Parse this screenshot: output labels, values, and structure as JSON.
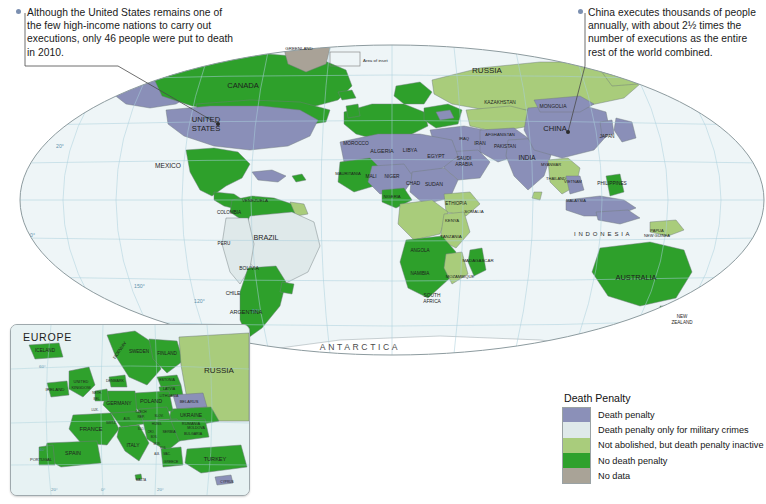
{
  "map": {
    "title": "World Map of the Death Penalty",
    "projection": "Robinson / elliptical world projection",
    "ocean_color": "#eef5f7",
    "graticule_color": "#9ec9d8",
    "border_color": "#8d9b9f"
  },
  "annotations": [
    {
      "id": "united-states-note",
      "text": "Although the United States remains one of the few high-income nations to carry out executions, only 46 people were put to death in 2010.",
      "target": "UNITED STATES"
    },
    {
      "id": "china-note",
      "text": "China executes thousands of people annually, with about 2½ times the number of executions as the entire rest of the world combined.",
      "target": "CHINA"
    }
  ],
  "legend": {
    "title": "Death Penalty",
    "items": [
      {
        "label": "Death penalty",
        "color": "#8b90b8"
      },
      {
        "label": "Death penalty only for military crimes",
        "color": "#dfe9ea"
      },
      {
        "label": "Not abolished, but death penalty inactive",
        "color": "#a9cc7c"
      },
      {
        "label": "No death penalty",
        "color": "#2fa12c"
      },
      {
        "label": "No data",
        "color": "#a9a397"
      }
    ]
  },
  "inset": {
    "title": "EUROPE",
    "note": "Area of inset",
    "labels": [
      "ICELAND",
      "NORWAY",
      "SWEDEN",
      "FINLAND",
      "RUSSIA",
      "ESTONIA",
      "LATVIA",
      "LITHUANIA",
      "BELARUS",
      "UKRAINE",
      "MOLDOVA",
      "POLAND",
      "GERMANY",
      "DENMARK",
      "NETH.",
      "BEL.",
      "LUX.",
      "UNITED KINGDOM",
      "IRELAND",
      "FRANCE",
      "SWITZ.",
      "SPAIN",
      "PORTUGAL",
      "ITALY",
      "CZECH REP.",
      "SLOVAKIA",
      "AUSTRIA",
      "HUNG.",
      "SLOVENIA",
      "CROATIA",
      "BOS. &amp; HERZ.",
      "SERBIA",
      "MONT.",
      "KOS.",
      "MACEDONIA",
      "ALBANIA",
      "GREECE",
      "BULGARIA",
      "RUMANIA",
      "TURKEY",
      "CYPRUS",
      "MALTA",
      "ANDORRA"
    ],
    "graticule_labels": [
      "60°",
      "40°",
      "20°",
      "0°",
      "20°"
    ]
  },
  "graticule": {
    "longitude_labels": [
      "150°",
      "120°",
      "90°",
      "60°",
      "30°",
      "0°",
      "30°",
      "60°",
      "90°",
      "120°",
      "150°"
    ],
    "latitude_labels": [
      "60°",
      "40°",
      "20°",
      "0°",
      "20°",
      "40°",
      "60°"
    ]
  },
  "map_labels": {
    "oceania_continent": "ANTARCTICA",
    "indonesia_spaced": "I N D O N E S I A",
    "regions": [
      {
        "name": "CANADA",
        "x": 243,
        "y": 88,
        "size": 7.6,
        "cls": "big"
      },
      {
        "name": "UNITED\nSTATES",
        "x": 206,
        "y": 122,
        "size": 7.6,
        "cls": "big"
      },
      {
        "name": "MEXICO",
        "x": 168,
        "y": 168,
        "size": 6.6,
        "cls": "big"
      },
      {
        "name": "GREENLAND",
        "x": 299,
        "y": 50,
        "size": 4.4,
        "cls": "sm"
      },
      {
        "name": "BRAZIL",
        "x": 266,
        "y": 240,
        "size": 7.2,
        "cls": "big"
      },
      {
        "name": "ARGENTINA",
        "x": 246,
        "y": 314,
        "size": 5.6,
        "cls": "med"
      },
      {
        "name": "CHILE",
        "x": 233,
        "y": 295,
        "size": 5.0,
        "cls": "med"
      },
      {
        "name": "PERU",
        "x": 224,
        "y": 245,
        "size": 4.6,
        "cls": "sm"
      },
      {
        "name": "BOLIVIA",
        "x": 249,
        "y": 270,
        "size": 5.0,
        "cls": "med"
      },
      {
        "name": "COLOMBIA",
        "x": 229,
        "y": 214,
        "size": 4.6,
        "cls": "sm"
      },
      {
        "name": "VENEZUELA",
        "x": 255,
        "y": 202,
        "size": 4.4,
        "cls": "sm"
      },
      {
        "name": "RUSSIA",
        "x": 487,
        "y": 73,
        "size": 8.0,
        "cls": "big"
      },
      {
        "name": "CHINA",
        "x": 555,
        "y": 131,
        "size": 7.6,
        "cls": "big"
      },
      {
        "name": "INDIA",
        "x": 527,
        "y": 160,
        "size": 6.4,
        "cls": "big"
      },
      {
        "name": "MONGOLIA",
        "x": 553,
        "y": 108,
        "size": 5.0,
        "cls": "med"
      },
      {
        "name": "KAZAKHSTAN",
        "x": 500,
        "y": 104,
        "size": 4.8,
        "cls": "sm"
      },
      {
        "name": "AUSTRALIA",
        "x": 636,
        "y": 280,
        "size": 7.4,
        "cls": "big"
      },
      {
        "name": "NEW\nZEALAND",
        "x": 682,
        "y": 318,
        "size": 4.6,
        "cls": "sm"
      },
      {
        "name": "ALGERIA",
        "x": 382,
        "y": 153,
        "size": 5.4,
        "cls": "med"
      },
      {
        "name": "LIBYA",
        "x": 410,
        "y": 152,
        "size": 5.2,
        "cls": "med"
      },
      {
        "name": "EGYPT",
        "x": 436,
        "y": 158,
        "size": 5.2,
        "cls": "med"
      },
      {
        "name": "SUDAN",
        "x": 434,
        "y": 186,
        "size": 5.2,
        "cls": "med"
      },
      {
        "name": "CHAD",
        "x": 413,
        "y": 185,
        "size": 5.0,
        "cls": "med"
      },
      {
        "name": "NIGER",
        "x": 392,
        "y": 178,
        "size": 4.8,
        "cls": "sm"
      },
      {
        "name": "MALI",
        "x": 371,
        "y": 178,
        "size": 4.8,
        "cls": "sm"
      },
      {
        "name": "MOROCCO",
        "x": 356,
        "y": 145,
        "size": 4.8,
        "cls": "sm"
      },
      {
        "name": "MAURITANIA",
        "x": 348,
        "y": 175,
        "size": 4.2,
        "cls": "sm"
      },
      {
        "name": "NIGERIA",
        "x": 392,
        "y": 198,
        "size": 4.2,
        "cls": "sm"
      },
      {
        "name": "ETHIOPIA",
        "x": 456,
        "y": 205,
        "size": 4.6,
        "cls": "sm"
      },
      {
        "name": "SOMALIA",
        "x": 474,
        "y": 213,
        "size": 4.4,
        "cls": "sm"
      },
      {
        "name": "KENYA",
        "x": 452,
        "y": 222,
        "size": 4.2,
        "cls": "sm"
      },
      {
        "name": "TANZANIA",
        "x": 451,
        "y": 238,
        "size": 4.4,
        "cls": "sm"
      },
      {
        "name": "ANGOLA",
        "x": 420,
        "y": 252,
        "size": 4.6,
        "cls": "sm"
      },
      {
        "name": "NAMIBIA",
        "x": 420,
        "y": 275,
        "size": 4.6,
        "cls": "sm"
      },
      {
        "name": "SOUTH\nAFRICA",
        "x": 432,
        "y": 297,
        "size": 4.8,
        "cls": "sm"
      },
      {
        "name": "MADAGASCAR",
        "x": 478,
        "y": 262,
        "size": 4.4,
        "cls": "sm"
      },
      {
        "name": "MOZAMBIQUE",
        "x": 460,
        "y": 278,
        "size": 4.2,
        "cls": "sm"
      },
      {
        "name": "SAUDI\nARABIA",
        "x": 464,
        "y": 160,
        "size": 4.8,
        "cls": "sm"
      },
      {
        "name": "IRAN",
        "x": 480,
        "y": 145,
        "size": 4.8,
        "cls": "sm"
      },
      {
        "name": "IRAQ",
        "x": 464,
        "y": 140,
        "size": 4.2,
        "cls": "sm"
      },
      {
        "name": "PAKISTAN",
        "x": 505,
        "y": 148,
        "size": 4.6,
        "cls": "sm"
      },
      {
        "name": "AFGHANISTAN",
        "x": 500,
        "y": 136,
        "size": 4.2,
        "cls": "sm"
      },
      {
        "name": "PHILIPPINES",
        "x": 612,
        "y": 185,
        "size": 4.8,
        "cls": "sm"
      },
      {
        "name": "JAPAN",
        "x": 607,
        "y": 138,
        "size": 4.8,
        "cls": "sm"
      },
      {
        "name": "MYANMAR",
        "x": 551,
        "y": 166,
        "size": 4.0,
        "cls": "sm"
      },
      {
        "name": "THAILAND",
        "x": 556,
        "y": 180,
        "size": 4.0,
        "cls": "sm"
      },
      {
        "name": "VIETNAM",
        "x": 573,
        "y": 183,
        "size": 4.0,
        "cls": "sm"
      },
      {
        "name": "MALAYSIA",
        "x": 576,
        "y": 202,
        "size": 4.0,
        "cls": "sm"
      },
      {
        "name": "PAPUA\nNEW GUINEA",
        "x": 657,
        "y": 232,
        "size": 4.0,
        "cls": "sm"
      }
    ]
  }
}
